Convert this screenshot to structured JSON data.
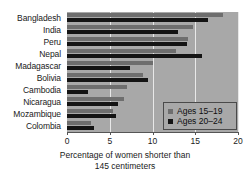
{
  "chart_data": {
    "type": "bar",
    "orientation": "horizontal",
    "title": "",
    "xlabel": "Percentage of women shorter than 145 centimeters",
    "ylabel": "",
    "xlim": [
      0,
      20
    ],
    "xticks": [
      0,
      5,
      10,
      15,
      20
    ],
    "xtick_labels": [
      "0",
      "5",
      "10",
      "15",
      "20"
    ],
    "grid": true,
    "grid_axis": "x",
    "legend_position": "center right",
    "categories": [
      "Bangladesh",
      "India",
      "Peru",
      "Nepal",
      "Madagascar",
      "Bolivia",
      "Cambodia",
      "Nicaragua",
      "Mozambique",
      "Colombia"
    ],
    "series": [
      {
        "name": "Ages 15–19",
        "color": "#6e6e6e",
        "values": [
          18.3,
          14.7,
          14.1,
          12.8,
          10.0,
          8.9,
          7.0,
          6.7,
          5.4,
          2.8
        ]
      },
      {
        "name": "Ages 20–24",
        "color": "#141414",
        "values": [
          16.5,
          13.0,
          14.0,
          15.8,
          7.4,
          9.5,
          2.5,
          6.0,
          5.7,
          3.1
        ]
      }
    ]
  },
  "caption": {
    "line1": "Percentage of women shorter than",
    "line2": "145 centimeters"
  },
  "colors": {
    "plot_background": "#a8a8a8",
    "gridline": "#e8e8e8",
    "axis": "#555555",
    "series_a": "#6e6e6e",
    "series_b": "#141414",
    "legend_border": "#4a4a4a"
  }
}
